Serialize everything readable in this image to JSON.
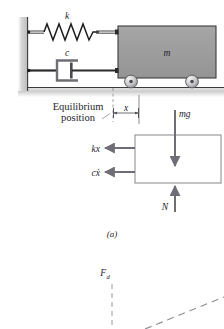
{
  "figure": {
    "part_label": "(a)",
    "colors": {
      "mass_fill": "#9a9a9a",
      "mass_stroke": "#3c3c3c",
      "wall_fill": "#c8c8c8",
      "ground_fill": "#d2d2d2",
      "line": "#2b2b2b",
      "arrow": "#6e6e74",
      "fbd_stroke": "#7b7b82",
      "dashed": "#8c8c92",
      "text": "#24242a"
    }
  },
  "schematic": {
    "spring_label": "k",
    "damper_label": "c",
    "mass_label": "m",
    "equilibrium_label_line1": "Equilibrium",
    "equilibrium_label_line2": "position",
    "displacement_label": "x"
  },
  "free_body_diagram": {
    "weight_label": "mg",
    "spring_force_label": "kx",
    "damper_force_label": "cẋ",
    "damper_force_base": "c",
    "damper_force_var": "x",
    "normal_force_label": "N"
  },
  "lower_plot": {
    "force_label": "F",
    "force_subscript": "d"
  }
}
